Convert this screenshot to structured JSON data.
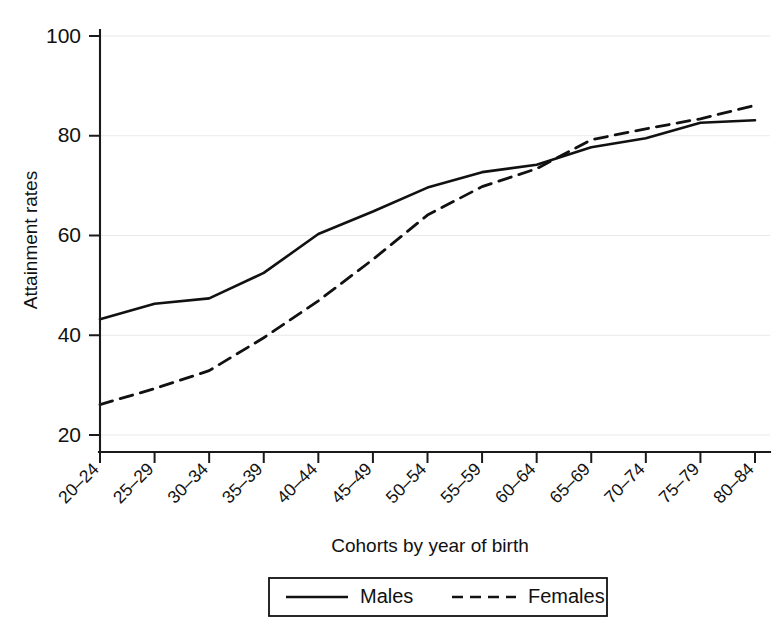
{
  "chart_data": {
    "type": "line",
    "title": "",
    "xlabel": "Cohorts by year of birth",
    "ylabel": "Attainment rates",
    "categories": [
      "20–24",
      "25–29",
      "30–34",
      "35–39",
      "40–44",
      "45–49",
      "50–54",
      "55–59",
      "60–64",
      "65–69",
      "70–74",
      "75–79",
      "80–84"
    ],
    "series": [
      {
        "name": "Males",
        "style": "solid",
        "color": "#111111",
        "values": [
          43.2,
          46.3,
          47.4,
          52.5,
          60.3,
          64.8,
          69.6,
          72.7,
          74.2,
          77.7,
          79.5,
          82.6,
          83.1
        ]
      },
      {
        "name": "Females",
        "style": "dashed",
        "color": "#111111",
        "values": [
          26.1,
          29.3,
          32.9,
          39.5,
          46.9,
          55.2,
          64.1,
          69.8,
          73.4,
          79.2,
          81.4,
          83.4,
          86.1
        ]
      }
    ],
    "ylim": [
      20,
      100
    ],
    "yticks": [
      20,
      40,
      60,
      80,
      100
    ],
    "ytick_labels": [
      "20",
      "40",
      "60",
      "80",
      "100"
    ],
    "grid": true,
    "grid_axis": "y",
    "legend": {
      "position": "bottom-center",
      "entries": [
        "Males",
        "Females"
      ]
    }
  },
  "legend": {
    "males_label": "Males",
    "females_label": "Females"
  },
  "axes": {
    "y_title": "Attainment rates",
    "x_title": "Cohorts by year of birth"
  }
}
